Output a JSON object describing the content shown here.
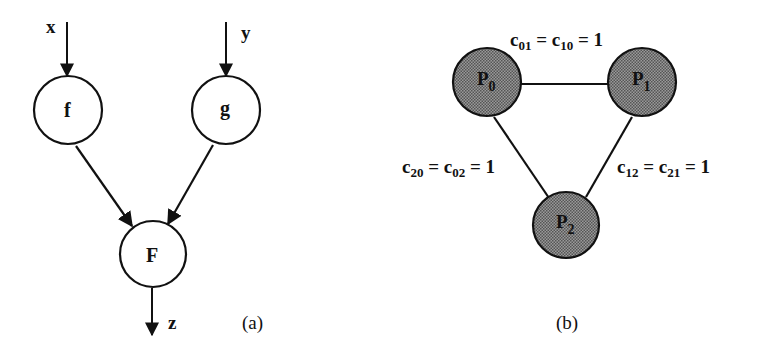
{
  "figure_a": {
    "caption": "(a)",
    "inputs": [
      {
        "label": "x",
        "target": "f"
      },
      {
        "label": "y",
        "target": "g"
      }
    ],
    "nodes": [
      {
        "id": "f",
        "label": "f"
      },
      {
        "id": "g",
        "label": "g"
      },
      {
        "id": "F",
        "label": "F"
      }
    ],
    "edges": [
      {
        "from": "f",
        "to": "F"
      },
      {
        "from": "g",
        "to": "F"
      }
    ],
    "output": {
      "label": "z",
      "source": "F"
    }
  },
  "figure_b": {
    "caption": "(b)",
    "nodes": [
      {
        "id": "P0",
        "base": "P",
        "sub": "0"
      },
      {
        "id": "P1",
        "base": "P",
        "sub": "1"
      },
      {
        "id": "P2",
        "base": "P",
        "sub": "2"
      }
    ],
    "edges": [
      {
        "from": "P0",
        "to": "P1",
        "label": {
          "c_a": "01",
          "c_b": "10",
          "value": "1"
        }
      },
      {
        "from": "P0",
        "to": "P2",
        "label": {
          "c_a": "20",
          "c_b": "02",
          "value": "1"
        }
      },
      {
        "from": "P1",
        "to": "P2",
        "label": {
          "c_a": "12",
          "c_b": "21",
          "value": "1"
        }
      }
    ],
    "symbols": {
      "c": "c",
      "eq": "="
    }
  },
  "colors": {
    "line": "#111111",
    "node_fill_b": "#8a8a8a",
    "background": "#ffffff"
  }
}
